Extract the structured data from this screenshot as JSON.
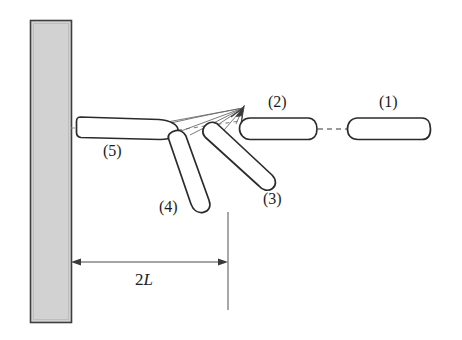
{
  "figure": {
    "type": "physics-schematic",
    "width": 462,
    "height": 340,
    "background_color": "#ffffff",
    "line_color": "#2b2b2b",
    "thin_line_color": "#6e6e6e",
    "wall": {
      "name": "rigid-wall",
      "fill_color": "#d2d2d2",
      "stroke_color": "#444444",
      "x": 30,
      "y": 20,
      "width": 41,
      "height": 302
    },
    "rods": [
      {
        "id": "1",
        "label": "(1)",
        "label_x": 379,
        "label_y": 93,
        "state": "incoming-horizontal",
        "cx": 389,
        "cy": 129,
        "length": 82,
        "thickness": 21,
        "angle_deg": 0
      },
      {
        "id": "2",
        "label": "(2)",
        "label_x": 268,
        "label_y": 93,
        "state": "at-contact-horizontal",
        "cx": 277,
        "cy": 129,
        "length": 76,
        "thickness": 22,
        "angle_deg": 0
      },
      {
        "id": "3",
        "label": "(3)",
        "label_x": 263,
        "label_y": 190,
        "state": "rotating-first",
        "cx": 241,
        "cy": 158,
        "length": 80,
        "thickness": 21,
        "angle_deg": 41
      },
      {
        "id": "4",
        "label": "(4)",
        "label_x": 159,
        "label_y": 198,
        "state": "rotating-second",
        "cx": 193,
        "cy": 170,
        "length": 84,
        "thickness": 20,
        "angle_deg": 79
      },
      {
        "id": "5",
        "label": "(5)",
        "label_x": 103,
        "label_y": 142,
        "state": "at-wall-horizontal",
        "cx": 124,
        "cy": 127,
        "length": 88,
        "thickness": 21,
        "angle_deg": 0
      }
    ],
    "pivot": {
      "name": "contact-point",
      "x": 243,
      "y": 108
    },
    "axis_line": {
      "name": "trajectory-axis",
      "style": "dashed",
      "x1": 71,
      "y1": 129,
      "x2": 430,
      "y2": 129
    },
    "dimension": {
      "label": "2L",
      "label_prefix": "2",
      "label_variable": "L",
      "label_x": 135,
      "label_y": 270,
      "x1": 71,
      "x2": 228,
      "y": 262,
      "extension_line_x": 228,
      "extension_line_y1": 212,
      "extension_line_y2": 310
    }
  }
}
